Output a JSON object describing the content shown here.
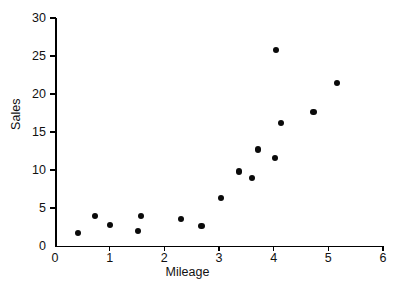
{
  "chart_data": {
    "type": "scatter",
    "title": "",
    "xlabel": "Mileage",
    "ylabel": "Sales",
    "xlim": [
      0,
      6
    ],
    "ylim": [
      0,
      30
    ],
    "xticks": [
      0,
      1,
      2,
      3,
      4,
      5,
      6
    ],
    "yticks": [
      0,
      5,
      10,
      15,
      20,
      25,
      30
    ],
    "xtick_labels": [
      "0",
      "1",
      "2",
      "3",
      "4",
      "5",
      "6"
    ],
    "ytick_labels": [
      "0",
      "5",
      "10",
      "15",
      "20",
      "25",
      "30"
    ],
    "grid": false,
    "legend": null,
    "marker": {
      "shape": "circle",
      "color": "#0a0a0a",
      "size_px": 6.2
    },
    "series": [
      {
        "name": "Sales vs Mileage",
        "points": [
          {
            "x": 0.42,
            "y": 1.7
          },
          {
            "x": 0.73,
            "y": 3.9
          },
          {
            "x": 1.0,
            "y": 2.8
          },
          {
            "x": 1.52,
            "y": 2.0
          },
          {
            "x": 1.58,
            "y": 4.0
          },
          {
            "x": 2.3,
            "y": 3.5
          },
          {
            "x": 2.68,
            "y": 2.6
          },
          {
            "x": 3.04,
            "y": 6.3
          },
          {
            "x": 3.36,
            "y": 9.8
          },
          {
            "x": 3.6,
            "y": 8.9
          },
          {
            "x": 3.71,
            "y": 12.7
          },
          {
            "x": 4.02,
            "y": 11.6
          },
          {
            "x": 4.05,
            "y": 25.8
          },
          {
            "x": 4.13,
            "y": 16.2
          },
          {
            "x": 4.73,
            "y": 17.6
          },
          {
            "x": 5.16,
            "y": 21.5
          }
        ]
      }
    ]
  }
}
